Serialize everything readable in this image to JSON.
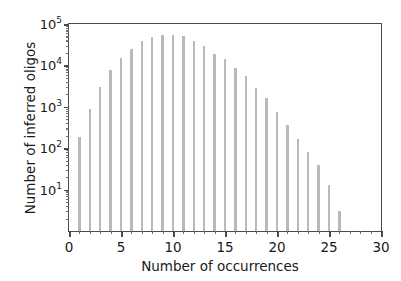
{
  "chart_data": {
    "type": "bar",
    "title": "",
    "xlabel": "Number of occurrences",
    "ylabel": "Number of inferred oligos",
    "yscale": "log",
    "xlim": [
      0,
      30
    ],
    "ylim": [
      1,
      100000
    ],
    "grid": false,
    "legend": null,
    "bar_color": "#b9b9b9",
    "axis_color": "#4a4a4a",
    "xticks": [
      0,
      5,
      10,
      15,
      20,
      25,
      30
    ],
    "xtick_labels": [
      "0",
      "5",
      "10",
      "15",
      "20",
      "25",
      "30"
    ],
    "xtick_minor_step": 1,
    "yticks": [
      10,
      100,
      1000,
      10000,
      100000
    ],
    "ytick_labels": [
      "10",
      "10",
      "10",
      "10",
      "10"
    ],
    "ytick_exponents": [
      "1",
      "2",
      "3",
      "4",
      "5"
    ],
    "x": [
      1,
      2,
      3,
      4,
      5,
      6,
      7,
      8,
      9,
      10,
      11,
      12,
      13,
      14,
      15,
      16,
      17,
      18,
      19,
      20,
      21,
      22,
      23,
      24,
      25,
      26
    ],
    "values": [
      190,
      900,
      3000,
      7800,
      15000,
      25000,
      38000,
      48000,
      53000,
      53000,
      50000,
      38000,
      29000,
      19000,
      14000,
      8700,
      5400,
      2800,
      1600,
      760,
      370,
      165,
      80,
      40,
      13,
      3
    ]
  },
  "figure": {
    "ylabel_text": "Number of inferred oligos",
    "xlabel_text": "Number of occurrences"
  }
}
